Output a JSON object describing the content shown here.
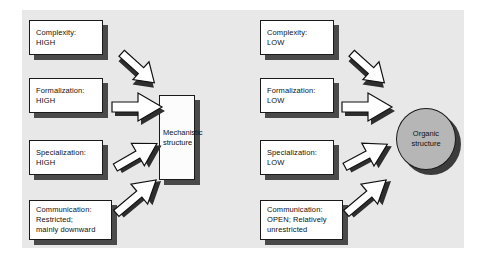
{
  "diagram": {
    "background_color": "#ffffff",
    "panel_color": "#e8e8e8",
    "box_fill": "#ffffff",
    "box_border": "#1a1a1a",
    "shadow_color": "#4a4a4a",
    "arrow_fill": "#ffffff",
    "arrow_shadow": "#2e2e2e",
    "organic_fill": "#b6b6b6"
  },
  "left_column": {
    "heading": "Mechanistic determinants",
    "boxes": [
      {
        "id": "complexity-high",
        "text": "Complexity:\nHIGH"
      },
      {
        "id": "formalization-high",
        "text": "Formalization:\nHIGH"
      },
      {
        "id": "specialization-high",
        "text": "Specialization:\nHIGH"
      },
      {
        "id": "communication-restricted",
        "text": "Communication:\nRestricted;\nmainly downward"
      }
    ]
  },
  "right_column": {
    "heading": "Organic determinants",
    "boxes": [
      {
        "id": "complexity-low",
        "text": "Complexity:\nLOW"
      },
      {
        "id": "formalization-low",
        "text": "Formalization:\nLOW"
      },
      {
        "id": "specialization-low",
        "text": "Specialization:\nLOW"
      },
      {
        "id": "communication-open",
        "text": "Communication:\nOPEN; Relatively\nunrestricted"
      }
    ]
  },
  "outcomes": {
    "mechanistic": {
      "id": "mechanistic-structure",
      "text": "Mechanistic\nstructure",
      "shape": "rectangle"
    },
    "organic": {
      "id": "organic-structure",
      "text": "Organic\nstructure",
      "shape": "ellipse"
    }
  },
  "arrows": {
    "left": [
      {
        "id": "arrow-complexity-high",
        "direction": "down-right"
      },
      {
        "id": "arrow-formalization-high",
        "direction": "right"
      },
      {
        "id": "arrow-specialization-high",
        "direction": "up-right"
      },
      {
        "id": "arrow-communication-restricted",
        "direction": "up-right-steep"
      }
    ],
    "right": [
      {
        "id": "arrow-complexity-low",
        "direction": "down-right"
      },
      {
        "id": "arrow-formalization-low",
        "direction": "right"
      },
      {
        "id": "arrow-specialization-low",
        "direction": "up-right"
      },
      {
        "id": "arrow-communication-open",
        "direction": "up-right-steep"
      }
    ]
  }
}
